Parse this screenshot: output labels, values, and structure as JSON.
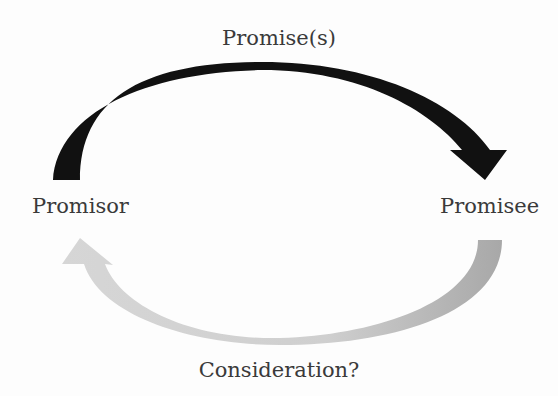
{
  "diagram": {
    "title": "",
    "nodes": [
      {
        "id": "promisor",
        "label": "Promisor"
      },
      {
        "id": "promisee",
        "label": "Promisee"
      }
    ],
    "edges": [
      {
        "from": "promisor",
        "to": "promisee",
        "label": "Promise(s)",
        "color": "#111111"
      },
      {
        "from": "promisee",
        "to": "promisor",
        "label": "Consideration?",
        "color": "#c4c4c4"
      }
    ]
  },
  "labels": {
    "promise": "Promise(s)",
    "promisor": "Promisor",
    "promisee": "Promisee",
    "consideration": "Consideration?"
  },
  "colors": {
    "promise_arrow": "#111111",
    "consideration_arrow_light": "#d4d4d4",
    "consideration_arrow_dark": "#a9a9a9",
    "text": "#3a3a3a"
  }
}
